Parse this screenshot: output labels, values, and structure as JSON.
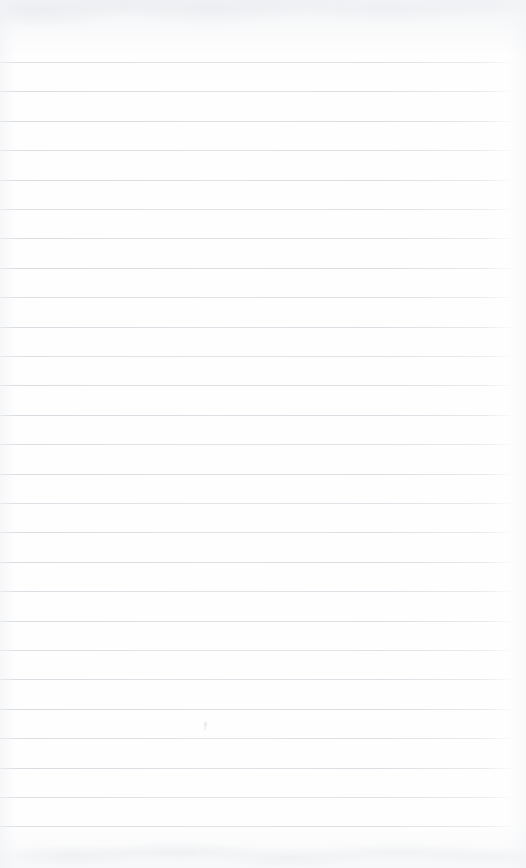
{
  "document": {
    "type": "scanned-lined-notepad-page",
    "description": "Blank ruled notebook page scan",
    "text_content": "",
    "visible_text_lines": [],
    "page_width_px": 526,
    "page_height_px": 868
  },
  "paper": {
    "background_color": "#fefefe",
    "texture_tint_color": "#e9ebef",
    "edge_shadow_color": "#f0f1f4"
  },
  "ruling": {
    "line_color": "#d6d9de",
    "line_thickness_px": 1,
    "line_spacing_px": 29.4,
    "first_line_y_px": 62,
    "last_line_y_px": 826,
    "line_start_x_px": 0,
    "line_end_x_px": 515,
    "line_count": 27,
    "line_y_positions": [
      62,
      91.4,
      120.8,
      150.2,
      179.6,
      209,
      238.4,
      267.8,
      297.2,
      326.6,
      356,
      385.4,
      414.8,
      444.2,
      473.6,
      503,
      532.4,
      561.8,
      591.2,
      620.6,
      650,
      679.4,
      708.8,
      738.2,
      767.6,
      797,
      826.4
    ]
  },
  "marks": [
    {
      "name": "pencil-smudge",
      "x_px": 202,
      "y_px": 720,
      "width_px": 7,
      "height_px": 11
    }
  ]
}
